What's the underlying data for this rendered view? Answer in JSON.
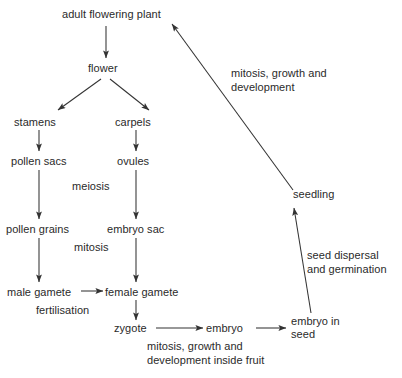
{
  "diagram": {
    "type": "flowchart",
    "background_color": "#ffffff",
    "text_color": "#2a2a2a",
    "arrow_color": "#333333",
    "nodes": [
      {
        "id": "adult_flowering_plant",
        "label": "adult flowering plant",
        "x": 114,
        "y": 14
      },
      {
        "id": "flower",
        "label": "flower",
        "x": 100,
        "y": 68
      },
      {
        "id": "stamens",
        "label": "stamens",
        "x": 43,
        "y": 122
      },
      {
        "id": "carpels",
        "label": "carpels",
        "x": 141,
        "y": 122
      },
      {
        "id": "pollen_sacs",
        "label": "pollen sacs",
        "x": 43,
        "y": 161
      },
      {
        "id": "ovules",
        "label": "ovules",
        "x": 141,
        "y": 161
      },
      {
        "id": "pollen_grains",
        "label": "pollen grains",
        "x": 43,
        "y": 229
      },
      {
        "id": "embryo_sac",
        "label": "embryo sac",
        "x": 141,
        "y": 229
      },
      {
        "id": "male_gamete",
        "label": "male gamete",
        "x": 43,
        "y": 292
      },
      {
        "id": "female_gamete",
        "label": "female gamete",
        "x": 141,
        "y": 292
      },
      {
        "id": "zygote",
        "label": "zygote",
        "x": 131,
        "y": 329
      },
      {
        "id": "embryo",
        "label": "embryo",
        "x": 229,
        "y": 329
      },
      {
        "id": "embryo_in_seed",
        "label": "embryo in\nseed",
        "x": 293,
        "y": 321
      },
      {
        "id": "seedling",
        "label": "seedling",
        "x": 293,
        "y": 194
      }
    ],
    "process_labels": [
      {
        "id": "meiosis",
        "label": "meiosis",
        "x": 74,
        "y": 185
      },
      {
        "id": "mitosis",
        "label": "mitosis",
        "x": 76,
        "y": 245
      },
      {
        "id": "fertilisation",
        "label": "fertilisation",
        "x": 38,
        "y": 308
      },
      {
        "id": "mitosis_growth_development_inside_fruit",
        "label": "mitosis, growth and\ndevelopment inside fruit",
        "x": 148,
        "y": 344
      },
      {
        "id": "seed_dispersal_and_germination",
        "label": "seed dispersal\nand germination",
        "x": 310,
        "y": 254
      },
      {
        "id": "mitosis_growth_and_development",
        "label": "mitosis, growth and\ndevelopment",
        "x": 232,
        "y": 72
      }
    ],
    "edges": [
      {
        "id": "plant-to-flower",
        "from": "adult_flowering_plant",
        "to": "flower"
      },
      {
        "id": "flower-to-stamens",
        "from": "flower",
        "to": "stamens"
      },
      {
        "id": "flower-to-carpels",
        "from": "flower",
        "to": "carpels"
      },
      {
        "id": "stamens-to-pollen-sacs",
        "from": "stamens",
        "to": "pollen_sacs"
      },
      {
        "id": "carpels-to-ovules",
        "from": "carpels",
        "to": "ovules"
      },
      {
        "id": "pollen-sacs-to-pollen-grains",
        "from": "pollen_sacs",
        "to": "pollen_grains",
        "label": "meiosis"
      },
      {
        "id": "ovules-to-embryo-sac",
        "from": "ovules",
        "to": "embryo_sac",
        "label": "meiosis"
      },
      {
        "id": "pollen-grains-to-male-gamete",
        "from": "pollen_grains",
        "to": "male_gamete",
        "label": "mitosis"
      },
      {
        "id": "embryo-sac-to-female-gamete",
        "from": "embryo_sac",
        "to": "female_gamete",
        "label": "mitosis"
      },
      {
        "id": "male-gamete-to-female-gamete",
        "from": "male_gamete",
        "to": "female_gamete",
        "label": "fertilisation"
      },
      {
        "id": "female-gamete-to-zygote",
        "from": "female_gamete",
        "to": "zygote"
      },
      {
        "id": "zygote-to-embryo",
        "from": "zygote",
        "to": "embryo",
        "label": "mitosis, growth and development inside fruit"
      },
      {
        "id": "embryo-to-embryo-in-seed",
        "from": "embryo",
        "to": "embryo_in_seed"
      },
      {
        "id": "embryo-in-seed-to-seedling",
        "from": "embryo_in_seed",
        "to": "seedling",
        "label": "seed dispersal and germination"
      },
      {
        "id": "seedling-to-adult-plant",
        "from": "seedling",
        "to": "adult_flowering_plant",
        "label": "mitosis, growth and development"
      }
    ]
  }
}
